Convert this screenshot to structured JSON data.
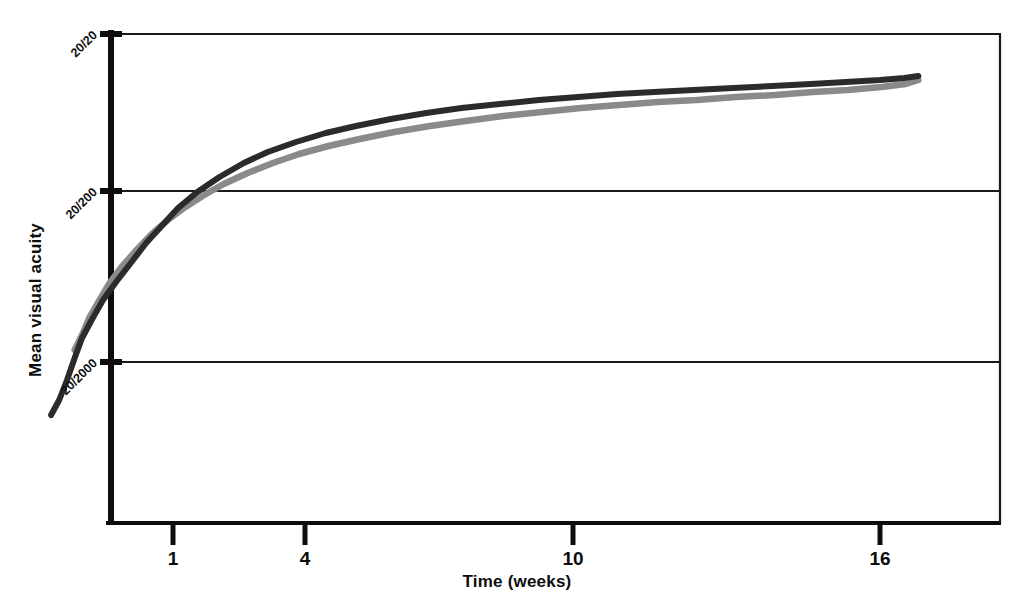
{
  "chart_data": {
    "type": "line",
    "title": "",
    "xlabel": "Time  (weeks)",
    "ylabel": "Mean visual acuity",
    "x_scale": "log",
    "x_tick_labels": [
      "1",
      "4",
      "10",
      "16"
    ],
    "x_tick_values": [
      1,
      4,
      10,
      16
    ],
    "y_tick_labels": [
      "20/20",
      "20/200",
      "20/2000"
    ],
    "grid": "horizontal",
    "legend": "none",
    "xlim": [
      0.55,
      19
    ],
    "ylim_labels_top_to_bottom": [
      "20/20",
      "20/200",
      "20/2000"
    ],
    "series": [
      {
        "name": "dark-curve",
        "color": "#2b2b2b",
        "x": [
          0.62,
          0.64,
          0.66,
          0.68,
          0.7,
          0.73,
          0.76,
          0.8,
          0.85,
          0.9,
          0.96,
          1.02,
          1.1,
          1.2,
          1.32,
          1.45,
          1.62,
          1.82,
          2.05,
          2.35,
          2.7,
          3.1,
          3.6,
          4.2,
          4.9,
          5.7,
          6.6,
          7.7,
          9.0,
          10.5,
          12.2,
          14.0,
          16.0,
          17.6,
          18.6
        ],
        "y_px": [
          415,
          400,
          380,
          358,
          338,
          318,
          300,
          282,
          262,
          243,
          225,
          208,
          192,
          177,
          163,
          152,
          142,
          133,
          126,
          119,
          113,
          108,
          104,
          100,
          97,
          94,
          92,
          90,
          88,
          86,
          84,
          82,
          80,
          78,
          76
        ]
      },
      {
        "name": "gray-curve",
        "color": "#8a8a8a",
        "x": [
          0.68,
          0.7,
          0.72,
          0.75,
          0.78,
          0.82,
          0.87,
          0.92,
          0.98,
          1.05,
          1.13,
          1.22,
          1.34,
          1.48,
          1.64,
          1.84,
          2.08,
          2.38,
          2.74,
          3.15,
          3.65,
          4.25,
          4.95,
          5.75,
          6.7,
          7.8,
          9.1,
          10.6,
          12.3,
          14.1,
          16.1,
          17.7,
          18.6
        ],
        "y_px": [
          350,
          335,
          318,
          300,
          283,
          266,
          249,
          234,
          220,
          207,
          195,
          184,
          173,
          163,
          154,
          146,
          139,
          132,
          126,
          121,
          116,
          112,
          108,
          105,
          102,
          100,
          97,
          95,
          92,
          90,
          87,
          84,
          80
        ]
      }
    ]
  },
  "axes": {
    "y_title": "Mean visual acuity",
    "x_title": "Time  (weeks)",
    "y_ticks": [
      {
        "label": "20/20",
        "y": 34
      },
      {
        "label": "20/200",
        "y": 191
      },
      {
        "label": "20/2000",
        "y": 362
      }
    ],
    "x_ticks": [
      {
        "label": "1",
        "x": 173
      },
      {
        "label": "4",
        "x": 305
      },
      {
        "label": "10",
        "x": 573
      },
      {
        "label": "16",
        "x": 880
      }
    ]
  },
  "colors": {
    "axis": "#0d0d0d",
    "grid": "#1a1a1a",
    "series_dark": "#2b2b2b",
    "series_gray": "#8a8a8a",
    "background": "#ffffff"
  }
}
